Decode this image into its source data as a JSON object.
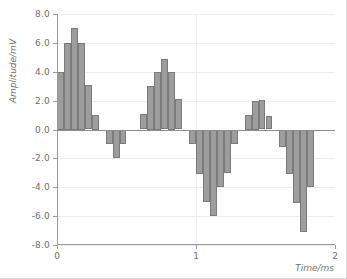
{
  "chart_data": {
    "type": "bar",
    "title": "",
    "xlabel": "Time/ms",
    "ylabel": "Amplitude/mV",
    "xlim": [
      0,
      2
    ],
    "ylim": [
      -8.0,
      8.0
    ],
    "grid": true,
    "legend": null,
    "bar_color": "#9d9d9d",
    "bar_edge_color": "#7b7b7b",
    "grid_color": "#ececec",
    "axis_color": "#9a9a9a",
    "tick_label_color": "#6f6f6f",
    "background_color": "#ffffff",
    "xticks": [
      0,
      1,
      2
    ],
    "xtick_labels": [
      "0",
      "1",
      "2"
    ],
    "yticks": [
      8.0,
      6.0,
      4.0,
      2.0,
      0.0,
      -2.0,
      -4.0,
      -6.0,
      -8.0
    ],
    "ytick_labels": [
      "8.0",
      "6.0",
      "4.0",
      "2.0",
      "0.0",
      "-2.0",
      "-4.0",
      "-6.0",
      "-8.0"
    ],
    "n_bars": 40,
    "bar_width_ms": 0.05,
    "x": [
      0.0,
      0.05,
      0.1,
      0.15,
      0.2,
      0.25,
      0.3,
      0.35,
      0.4,
      0.45,
      0.5,
      0.55,
      0.6,
      0.65,
      0.7,
      0.75,
      0.8,
      0.85,
      0.9,
      0.95,
      1.0,
      1.05,
      1.1,
      1.15,
      1.2,
      1.25,
      1.3,
      1.35,
      1.4,
      1.45,
      1.5,
      1.55,
      1.6,
      1.65,
      1.7,
      1.75,
      1.8,
      1.85,
      1.9,
      1.95
    ],
    "values": [
      4.0,
      6.0,
      7.0,
      6.0,
      3.1,
      1.0,
      0.0,
      -1.0,
      -2.0,
      -1.0,
      0.0,
      0.0,
      1.1,
      3.0,
      4.0,
      4.9,
      4.0,
      2.1,
      0.0,
      -1.0,
      -3.1,
      -5.0,
      -6.0,
      -4.0,
      -3.0,
      -1.0,
      0.0,
      1.0,
      2.0,
      2.05,
      0.95,
      0.0,
      -1.2,
      -3.1,
      -5.1,
      -7.1,
      -4.0,
      0.0,
      0.0,
      0.0
    ],
    "series_name": "amplitude"
  }
}
